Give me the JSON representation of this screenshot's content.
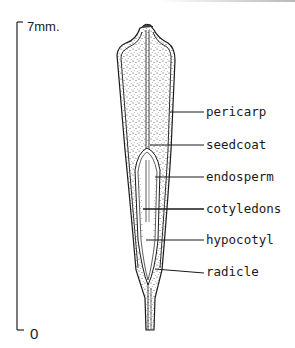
{
  "figure": {
    "type": "botanical cross-section diagram of a seed/fruit",
    "scale_bar": {
      "top_label": "7mm.",
      "bottom_label": "0"
    },
    "labels": [
      {
        "id": "pericarp",
        "text": "pericarp"
      },
      {
        "id": "seedcoat",
        "text": "seedcoat"
      },
      {
        "id": "endosperm",
        "text": "endosperm"
      },
      {
        "id": "cotyledons",
        "text": "cotyledons"
      },
      {
        "id": "hypocotyl",
        "text": "hypocotyl"
      },
      {
        "id": "radicle",
        "text": "radicle"
      }
    ],
    "colors": {
      "ink": "#1a1a1a",
      "background": "#ffffff",
      "stipple": "#3a3a3a"
    }
  }
}
